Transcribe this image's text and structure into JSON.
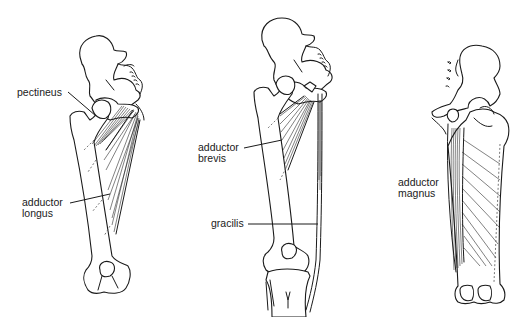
{
  "figures": [
    {
      "id": "left",
      "view": "anterior",
      "labels": [
        {
          "name": "pectineus",
          "lines": [
            "pectineus"
          ]
        },
        {
          "name": "adductor-longus",
          "lines": [
            "adductor",
            "longus"
          ]
        }
      ]
    },
    {
      "id": "middle",
      "view": "anterior",
      "labels": [
        {
          "name": "adductor-brevis",
          "lines": [
            "adductor",
            "brevis"
          ]
        },
        {
          "name": "gracilis",
          "lines": [
            "gracilis"
          ]
        }
      ]
    },
    {
      "id": "right",
      "view": "posterior",
      "labels": [
        {
          "name": "adductor-magnus",
          "lines": [
            "adductor",
            "magnus"
          ]
        }
      ]
    }
  ],
  "colors": {
    "ink": "#1a1a1a",
    "background": "#ffffff"
  }
}
